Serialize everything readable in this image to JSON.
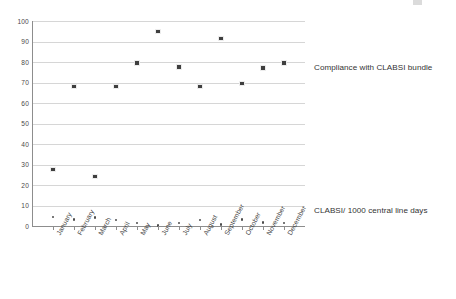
{
  "chart_data": {
    "type": "scatter",
    "title": "",
    "subtitle": "",
    "xlabel": "",
    "ylabel": "",
    "ylim": [
      0,
      100
    ],
    "y_ticks": [
      0,
      10,
      20,
      30,
      40,
      50,
      60,
      70,
      80,
      90,
      100
    ],
    "grid": "horizontal",
    "legend_position": "right-inline-annotations",
    "categories": [
      "January",
      "February",
      "March",
      "April",
      "May",
      "June",
      "July",
      "August",
      "September",
      "October",
      "November",
      "December"
    ],
    "series": [
      {
        "name": "Compliance with CLABSI bundle",
        "marker": "filled-square",
        "color": "#3f3f3f",
        "values": [
          27.5,
          68,
          24,
          68,
          79.5,
          95,
          77.5,
          68,
          91.5,
          69.5,
          77,
          79.5
        ]
      },
      {
        "name": "CLABSI/ 1000 central line days",
        "marker": "small-dot",
        "color": "#4c4c4c",
        "values": [
          4.5,
          3.2,
          4.1,
          3.0,
          1.5,
          0.2,
          1.6,
          2.8,
          0.7,
          3.2,
          1.8,
          1.5
        ]
      }
    ],
    "annotations": [
      {
        "id": "note-compliance",
        "text": "Compliance with CLABSI bundle"
      },
      {
        "id": "note-rate",
        "text": "CLABSI/ 1000 central line days"
      }
    ]
  },
  "labels": {
    "compliance_note": "Compliance with CLABSI bundle",
    "rate_note": "CLABSI/ 1000 central line days"
  }
}
